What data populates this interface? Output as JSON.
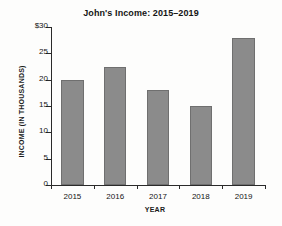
{
  "chart_data": {
    "type": "bar",
    "title": "John's Income: 2015–2019",
    "xlabel": "YEAR",
    "ylabel": "INCOME  (IN THOUSANDS)",
    "categories": [
      "2015",
      "2016",
      "2017",
      "2018",
      "2019"
    ],
    "values": [
      20,
      22.5,
      18,
      15,
      28
    ],
    "ylim": [
      0,
      30
    ],
    "ytick_values": [
      30,
      25,
      20,
      15,
      10,
      5,
      0
    ],
    "ytick_labels": [
      "$30",
      "25",
      "20",
      "15",
      "10",
      "5",
      "0"
    ],
    "grid": false,
    "legend": null,
    "bar_color": "#8b8b8b",
    "bar_edge_color": "#6f6f6f",
    "axis_color": "#2a2a2a",
    "background": "#fdfdfc"
  }
}
